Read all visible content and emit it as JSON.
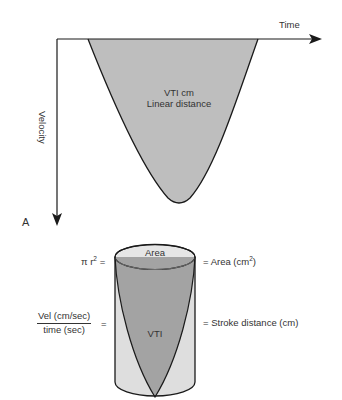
{
  "panel_a": {
    "panel_label": "A",
    "x_axis_label": "Time",
    "y_axis_label": "Velocity",
    "curve_label_line1": "VTI cm",
    "curve_label_line2": "Linear distance"
  },
  "cylinder": {
    "top_label": "Area",
    "inner_label": "VTI",
    "left_top_formula": "π r",
    "left_top_formula_sup": "2",
    "left_top_equals": "=",
    "right_top_text": "= Area (cm",
    "right_top_sup": "2",
    "right_top_close": ")",
    "left_mid_numerator": "Vel (cm/sec)",
    "left_mid_denominator": "time (sec)",
    "left_mid_equals": "=",
    "right_mid_text": "= Stroke distance (cm)"
  },
  "colors": {
    "curve_fill": "#bebebe",
    "cone_fill": "#a3a3a3",
    "cylinder_body": "#dedede",
    "ellipse_top": "#e6e6e6",
    "stroke": "#1a1a1a"
  }
}
